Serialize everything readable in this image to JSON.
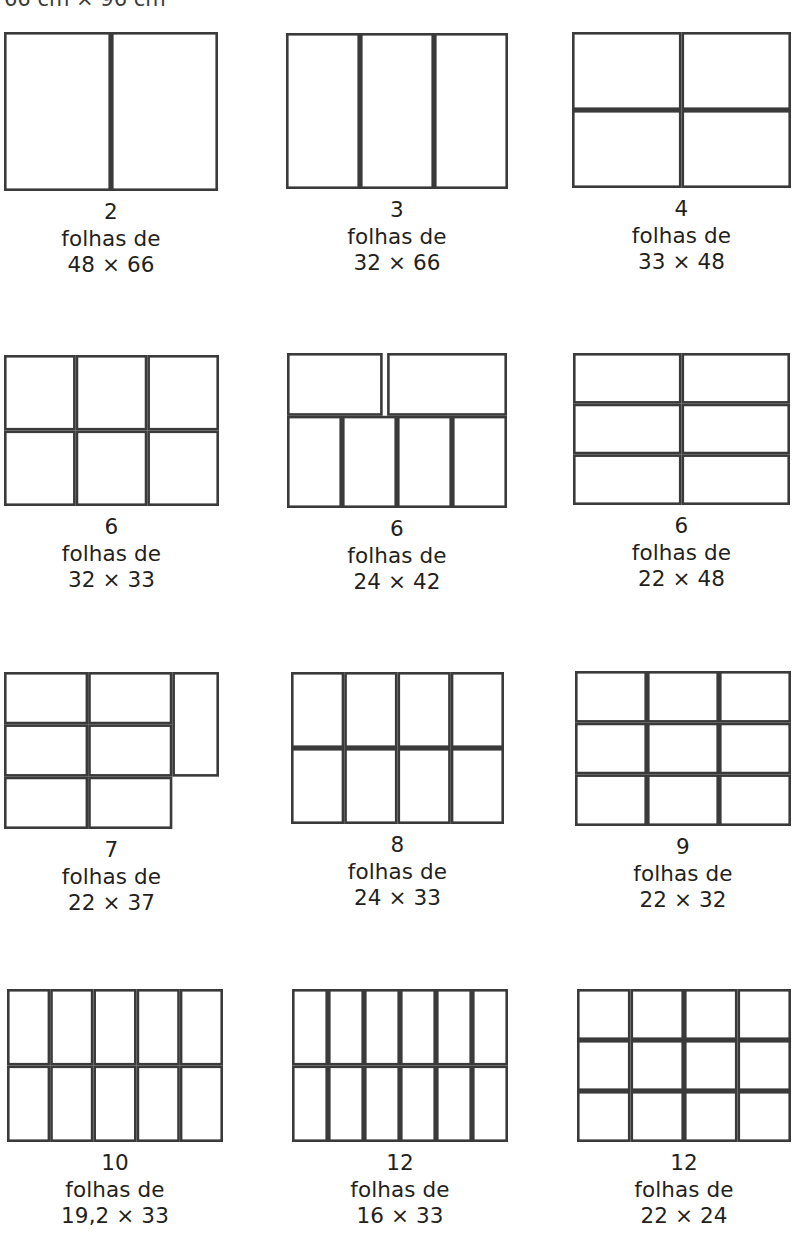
{
  "header": {
    "title": "66 cm × 96 cm"
  },
  "caption_word": "folhas de",
  "figures": [
    {
      "id": "fig-2-sheets",
      "count": "2",
      "middle": "folhas de",
      "dimensions": "48 × 66",
      "shape": "grid",
      "cols": 2,
      "rows": 1,
      "left": 4,
      "top": 32,
      "width": 214,
      "height": 159
    },
    {
      "id": "fig-3-sheets",
      "count": "3",
      "middle": "folhas de",
      "dimensions": "32 × 66",
      "shape": "grid",
      "cols": 3,
      "rows": 1,
      "left": 286,
      "top": 33,
      "width": 222,
      "height": 156
    },
    {
      "id": "fig-4-sheets",
      "count": "4",
      "middle": "folhas de",
      "dimensions": "33 × 48",
      "shape": "grid",
      "cols": 2,
      "rows": 2,
      "left": 572,
      "top": 32,
      "width": 219,
      "height": 156
    },
    {
      "id": "fig-6-sheets-32x33",
      "count": "6",
      "middle": "folhas de",
      "dimensions": "32 × 33",
      "shape": "grid",
      "cols": 3,
      "rows": 2,
      "left": 4,
      "top": 355,
      "width": 215,
      "height": 151
    },
    {
      "id": "fig-6-sheets-24x42",
      "count": "6",
      "middle": "folhas de",
      "dimensions": "24 × 42",
      "shape": "stepped-24x42",
      "left": 287,
      "top": 353,
      "width": 220,
      "height": 155
    },
    {
      "id": "fig-6-sheets-22x48",
      "count": "6",
      "middle": "folhas de",
      "dimensions": "22 × 48",
      "shape": "grid",
      "cols": 2,
      "rows": 3,
      "left": 573,
      "top": 353,
      "width": 217,
      "height": 152
    },
    {
      "id": "fig-7-sheets",
      "count": "7",
      "middle": "folhas de",
      "dimensions": "22 × 37",
      "shape": "stepped-22x37",
      "left": 4,
      "top": 672,
      "width": 215,
      "height": 157
    },
    {
      "id": "fig-8-sheets",
      "count": "8",
      "middle": "folhas de",
      "dimensions": "24 × 33",
      "shape": "grid",
      "cols": 4,
      "rows": 2,
      "left": 291,
      "top": 672,
      "width": 213,
      "height": 152
    },
    {
      "id": "fig-9-sheets",
      "count": "9",
      "middle": "folhas de",
      "dimensions": "22 × 32",
      "shape": "grid",
      "cols": 3,
      "rows": 3,
      "left": 575,
      "top": 671,
      "width": 216,
      "height": 155
    },
    {
      "id": "fig-10-sheets",
      "count": "10",
      "middle": "folhas de",
      "dimensions": "19,2 × 33",
      "shape": "grid",
      "cols": 5,
      "rows": 2,
      "left": 7,
      "top": 989,
      "width": 216,
      "height": 153
    },
    {
      "id": "fig-12-sheets-16x33",
      "count": "12",
      "middle": "folhas de",
      "dimensions": "16 × 33",
      "shape": "grid",
      "cols": 6,
      "rows": 2,
      "left": 292,
      "top": 989,
      "width": 216,
      "height": 153
    },
    {
      "id": "fig-12-sheets-22x24",
      "count": "12",
      "middle": "folhas de",
      "dimensions": "22 × 24",
      "shape": "grid",
      "cols": 4,
      "rows": 3,
      "left": 577,
      "top": 989,
      "width": 214,
      "height": 153
    }
  ],
  "colors": {
    "stroke": "#3a3a3a",
    "text": "#231f20",
    "background": "#ffffff"
  }
}
